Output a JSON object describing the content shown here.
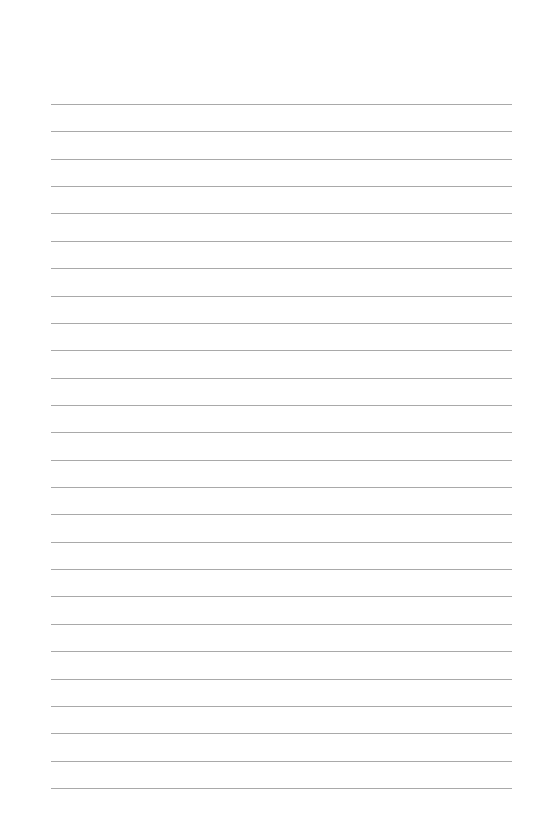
{
  "page": {
    "type": "lined-paper",
    "background": "#ffffff",
    "line_color": "#9a9a9a",
    "line_count": 26,
    "first_line_y": 104,
    "line_spacing": 27.36,
    "line_left": 51,
    "line_width": 461
  }
}
